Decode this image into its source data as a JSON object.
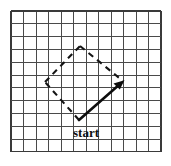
{
  "figure": {
    "background_color": "#ffffff",
    "labels": {
      "start": "start"
    },
    "colors": {
      "grid_line": "#4a4a4a",
      "grid_border": "#3a3a3a",
      "dashed_stroke": "#141414",
      "solid_stroke": "#0d0d0d",
      "label_text": "#111111"
    }
  },
  "grid": {
    "origin_x": 11,
    "origin_y": 11,
    "cell_width": 12.5,
    "cell_height": 12.8,
    "columns": 12,
    "rows": 11,
    "x_positions": [
      11,
      23.5,
      36,
      48.5,
      61,
      73.5,
      86,
      98.5,
      111,
      123.5,
      136,
      148.5,
      161
    ],
    "y_positions": [
      11,
      23.8,
      36.6,
      49.4,
      62.2,
      75,
      87.8,
      100.6,
      113.4,
      126.2,
      139,
      151.8
    ]
  },
  "shape": {
    "type": "rhombus",
    "vertices": {
      "start": {
        "x": 79,
        "y": 120,
        "label": "start"
      },
      "left": {
        "x": 45,
        "y": 82
      },
      "top": {
        "x": 80,
        "y": 46
      },
      "right": {
        "x": 123,
        "y": 81
      }
    },
    "edges": [
      {
        "name": "start-to-right",
        "style": "solid",
        "arrow": true,
        "from": "start",
        "to": "right"
      },
      {
        "name": "start-to-left",
        "style": "dashed",
        "arrow": false,
        "from": "start",
        "to": "left"
      },
      {
        "name": "left-to-top",
        "style": "dashed",
        "arrow": false,
        "from": "left",
        "to": "top"
      },
      {
        "name": "top-to-right",
        "style": "dashed",
        "arrow": false,
        "from": "top",
        "to": "right"
      }
    ],
    "dash_pattern": "6 5"
  },
  "annotations": {
    "start_label_x": 86,
    "start_label_y": 137
  }
}
